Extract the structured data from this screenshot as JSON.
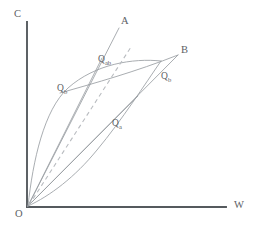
{
  "figure": {
    "type": "line-diagram",
    "background_color": "#ffffff",
    "stroke_color": "#9a9ea3",
    "axis_color": "#555a5e",
    "dashed_color": "#b9bcc0",
    "label_color": "#5d6165",
    "axes": {
      "vertical_label": "C",
      "horizontal_label": "W",
      "origin_label": "O"
    },
    "labels": {
      "line_a": "A",
      "line_b": "B",
      "q_ab": "Q",
      "q_ab_sub": "ab",
      "q_b_left": "Q",
      "q_b_left_sub": "b",
      "q_b_right": "Q",
      "q_b_right_sub": "b",
      "q_a": "Q",
      "q_a_sub": "a"
    }
  }
}
